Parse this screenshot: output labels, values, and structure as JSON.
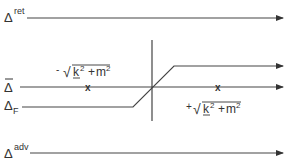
{
  "diagram": {
    "type": "complex-energy-plane contours",
    "contours": {
      "retarded": {
        "symbol": "Δ",
        "superscript": "ret"
      },
      "bar": {
        "symbol": "Δ",
        "accent": "bar"
      },
      "feynman": {
        "symbol": "Δ",
        "subscript": "F"
      },
      "advanced": {
        "symbol": "Δ",
        "superscript": "adv"
      }
    },
    "poles": {
      "negative": {
        "sign": "-",
        "expr": "√(k² + m²)",
        "k": "k",
        "exp": "2",
        "m": "m",
        "mexp": "2",
        "marker": "x"
      },
      "positive": {
        "sign": "+",
        "expr": "√(k² + m²)",
        "k": "k",
        "exp": "2",
        "m": "m",
        "mexp": "2",
        "marker": "x"
      }
    },
    "colors": {
      "line": "#444444",
      "text": "#333333",
      "background": "#ffffff"
    }
  }
}
